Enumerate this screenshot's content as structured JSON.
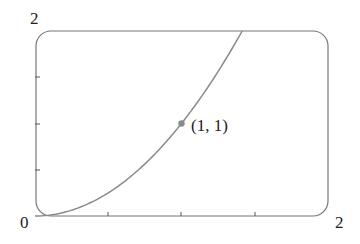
{
  "chart_data": {
    "type": "line",
    "title": "",
    "xlabel": "",
    "ylabel": "",
    "xlim": [
      0,
      2
    ],
    "ylim": [
      0,
      2
    ],
    "x_tick_labels": [
      "0",
      "2"
    ],
    "y_tick_labels": [
      "2"
    ],
    "x_ticks": [
      0.5,
      1,
      1.5
    ],
    "y_ticks": [
      0.5,
      1,
      1.5
    ],
    "grid": false,
    "series": [
      {
        "name": "y = x^2",
        "x": [
          0,
          0.25,
          0.5,
          0.75,
          1,
          1.25,
          1.414
        ],
        "y": [
          0,
          0.0625,
          0.25,
          0.5625,
          1,
          1.5625,
          2
        ]
      }
    ],
    "annotations": [
      {
        "x": 1,
        "y": 1,
        "label": "(1, 1)",
        "marker": "dot"
      }
    ]
  },
  "labels": {
    "y_max": "2",
    "origin": "0",
    "x_max": "2",
    "point": "(1, 1)"
  },
  "colors": {
    "frame": "#777777",
    "curve": "#8a8a8a",
    "point": "#8a8a8a",
    "text": "#222222"
  }
}
